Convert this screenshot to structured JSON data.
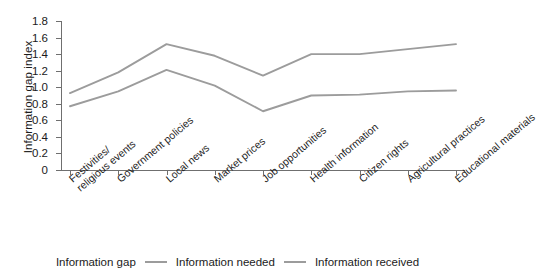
{
  "chart_data": {
    "type": "line",
    "title": "",
    "xlabel": "",
    "ylabel": "Information gap index",
    "ylim": [
      0,
      1.8
    ],
    "ytick_labels": [
      "1.8",
      "1.6",
      "1.4",
      "1.2",
      "1.0",
      "0.8",
      "0.6",
      "0.4",
      "0.2",
      "0"
    ],
    "ytick_values": [
      1.8,
      1.6,
      1.4,
      1.2,
      1.0,
      0.8,
      0.6,
      0.4,
      0.2,
      0
    ],
    "grid": false,
    "legend_position": "bottom",
    "categories": [
      "Festivities/\nreligious events",
      "Government policies",
      "Local news",
      "Market prices",
      "Job opportunities",
      "Health information",
      "Citizen rights",
      "Agricultural practices",
      "Educational materials"
    ],
    "category_lines": [
      [
        "Festivities/",
        "religious events"
      ],
      [
        "Government policies"
      ],
      [
        "Local news"
      ],
      [
        "Market prices"
      ],
      [
        "Job opportunities"
      ],
      [
        "Health information"
      ],
      [
        "Citizen rights"
      ],
      [
        "Agricultural practices"
      ],
      [
        "Educational materials"
      ]
    ],
    "series": [
      {
        "name": "Information needed",
        "color": "#9c9c9c",
        "values": [
          0.93,
          1.18,
          1.52,
          1.38,
          1.14,
          1.4,
          1.4,
          1.46,
          1.52
        ]
      },
      {
        "name": "Information received",
        "color": "#9c9c9c",
        "values": [
          0.77,
          0.95,
          1.21,
          1.02,
          0.71,
          0.9,
          0.91,
          0.95,
          0.96
        ]
      }
    ]
  },
  "legend": {
    "title": "Information gap",
    "items": [
      {
        "label": "Information needed",
        "color": "#9c9c9c"
      },
      {
        "label": "Information received",
        "color": "#9c9c9c"
      }
    ]
  },
  "axis": {
    "y_title": "Information gap index"
  },
  "colors": {
    "line": "#9c9c9c",
    "axis": "#6f6f6f",
    "text": "#1b1b1b",
    "background": "#ffffff"
  }
}
